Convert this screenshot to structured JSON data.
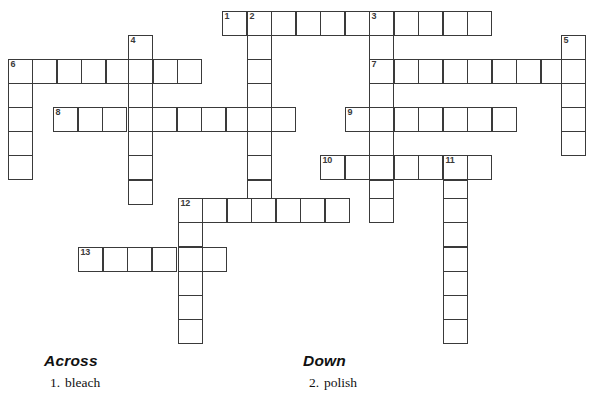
{
  "puzzle": {
    "title": "Crossword Puzzle",
    "cell_size": 24.6,
    "origin_x": 8,
    "origin_y": 10.5,
    "ink_color": "#3a3a3a",
    "cell_fill": "#ffffff",
    "page_background": "#ffffff",
    "entries": [
      {
        "number": "1",
        "direction": "across",
        "col": 0,
        "row": 0,
        "length": 11
      },
      {
        "number": "2",
        "direction": "down",
        "col": 1,
        "row": 0,
        "length": 9
      },
      {
        "number": "3",
        "direction": "down",
        "col": 6,
        "row": 0,
        "length": 7
      },
      {
        "number": "4",
        "direction": "down",
        "col": -11,
        "row": 1,
        "length": 7
      },
      {
        "number": "5",
        "direction": "down",
        "col": 13,
        "row": 1,
        "length": 5
      },
      {
        "number": "6",
        "direction": "across",
        "col": -16,
        "row": 2,
        "length": 8
      },
      {
        "number": "6",
        "direction": "down",
        "col": -16,
        "row": 2,
        "length": 5
      },
      {
        "number": "7",
        "direction": "across",
        "col": 4,
        "row": 2,
        "length": 9
      },
      {
        "number": "8",
        "direction": "across",
        "col": -14,
        "row": 4,
        "length": 10
      },
      {
        "number": "9",
        "direction": "across",
        "col": 2,
        "row": 4,
        "length": 7
      },
      {
        "number": "10",
        "direction": "across",
        "col": 1,
        "row": 6,
        "length": 7
      },
      {
        "number": "11",
        "direction": "down",
        "col": 6,
        "row": 6,
        "length": 8
      },
      {
        "number": "12",
        "direction": "across",
        "col": -8,
        "row": 8,
        "length": 7
      },
      {
        "number": "12",
        "direction": "down",
        "col": -8,
        "row": 8,
        "length": 6
      },
      {
        "number": "13",
        "direction": "across",
        "col": -12,
        "row": 10,
        "length": 6
      }
    ],
    "cells": [
      {
        "x": 222,
        "y": 11,
        "num": "1"
      },
      {
        "x": 247,
        "y": 11,
        "num": "2"
      },
      {
        "x": 271,
        "y": 11,
        "num": ""
      },
      {
        "x": 296,
        "y": 11,
        "num": ""
      },
      {
        "x": 320,
        "y": 11,
        "num": ""
      },
      {
        "x": 345,
        "y": 11,
        "num": ""
      },
      {
        "x": 369,
        "y": 11,
        "num": "3"
      },
      {
        "x": 394,
        "y": 11,
        "num": ""
      },
      {
        "x": 418,
        "y": 11,
        "num": ""
      },
      {
        "x": 443,
        "y": 11,
        "num": ""
      },
      {
        "x": 467,
        "y": 11,
        "num": ""
      },
      {
        "x": 128,
        "y": 35,
        "num": "4"
      },
      {
        "x": 247,
        "y": 35,
        "num": ""
      },
      {
        "x": 369,
        "y": 35,
        "num": ""
      },
      {
        "x": 561,
        "y": 35,
        "num": "5"
      },
      {
        "x": 8,
        "y": 59,
        "num": "6"
      },
      {
        "x": 32,
        "y": 59,
        "num": ""
      },
      {
        "x": 57,
        "y": 59,
        "num": ""
      },
      {
        "x": 81,
        "y": 59,
        "num": ""
      },
      {
        "x": 106,
        "y": 59,
        "num": ""
      },
      {
        "x": 128,
        "y": 59,
        "num": ""
      },
      {
        "x": 153,
        "y": 59,
        "num": ""
      },
      {
        "x": 177,
        "y": 59,
        "num": ""
      },
      {
        "x": 247,
        "y": 59,
        "num": ""
      },
      {
        "x": 369,
        "y": 59,
        "num": "7"
      },
      {
        "x": 394,
        "y": 59,
        "num": ""
      },
      {
        "x": 418,
        "y": 59,
        "num": ""
      },
      {
        "x": 443,
        "y": 59,
        "num": ""
      },
      {
        "x": 467,
        "y": 59,
        "num": ""
      },
      {
        "x": 492,
        "y": 59,
        "num": ""
      },
      {
        "x": 516,
        "y": 59,
        "num": ""
      },
      {
        "x": 541,
        "y": 59,
        "num": ""
      },
      {
        "x": 561,
        "y": 59,
        "num": ""
      },
      {
        "x": 8,
        "y": 83,
        "num": ""
      },
      {
        "x": 128,
        "y": 83,
        "num": ""
      },
      {
        "x": 247,
        "y": 83,
        "num": ""
      },
      {
        "x": 369,
        "y": 83,
        "num": ""
      },
      {
        "x": 561,
        "y": 83,
        "num": ""
      },
      {
        "x": 8,
        "y": 107,
        "num": ""
      },
      {
        "x": 53,
        "y": 107,
        "num": "8"
      },
      {
        "x": 78,
        "y": 107,
        "num": ""
      },
      {
        "x": 102,
        "y": 107,
        "num": ""
      },
      {
        "x": 128,
        "y": 107,
        "num": ""
      },
      {
        "x": 152,
        "y": 107,
        "num": ""
      },
      {
        "x": 177,
        "y": 107,
        "num": ""
      },
      {
        "x": 201,
        "y": 107,
        "num": ""
      },
      {
        "x": 226,
        "y": 107,
        "num": ""
      },
      {
        "x": 247,
        "y": 107,
        "num": ""
      },
      {
        "x": 271,
        "y": 107,
        "num": ""
      },
      {
        "x": 345,
        "y": 107,
        "num": "9"
      },
      {
        "x": 369,
        "y": 107,
        "num": ""
      },
      {
        "x": 394,
        "y": 107,
        "num": ""
      },
      {
        "x": 418,
        "y": 107,
        "num": ""
      },
      {
        "x": 443,
        "y": 107,
        "num": ""
      },
      {
        "x": 467,
        "y": 107,
        "num": ""
      },
      {
        "x": 492,
        "y": 107,
        "num": ""
      },
      {
        "x": 561,
        "y": 107,
        "num": ""
      },
      {
        "x": 8,
        "y": 131,
        "num": ""
      },
      {
        "x": 128,
        "y": 131,
        "num": ""
      },
      {
        "x": 247,
        "y": 131,
        "num": ""
      },
      {
        "x": 369,
        "y": 131,
        "num": ""
      },
      {
        "x": 561,
        "y": 131,
        "num": ""
      },
      {
        "x": 8,
        "y": 155,
        "num": ""
      },
      {
        "x": 128,
        "y": 155,
        "num": ""
      },
      {
        "x": 247,
        "y": 155,
        "num": ""
      },
      {
        "x": 320,
        "y": 155,
        "num": "10"
      },
      {
        "x": 345,
        "y": 155,
        "num": ""
      },
      {
        "x": 369,
        "y": 155,
        "num": ""
      },
      {
        "x": 394,
        "y": 155,
        "num": ""
      },
      {
        "x": 418,
        "y": 155,
        "num": ""
      },
      {
        "x": 443,
        "y": 155,
        "num": "11"
      },
      {
        "x": 467,
        "y": 155,
        "num": ""
      },
      {
        "x": 128,
        "y": 180,
        "num": ""
      },
      {
        "x": 247,
        "y": 180,
        "num": ""
      },
      {
        "x": 369,
        "y": 180,
        "num": ""
      },
      {
        "x": 443,
        "y": 180,
        "num": ""
      },
      {
        "x": 178,
        "y": 198,
        "num": "12"
      },
      {
        "x": 202,
        "y": 198,
        "num": ""
      },
      {
        "x": 227,
        "y": 198,
        "num": ""
      },
      {
        "x": 251,
        "y": 198,
        "num": ""
      },
      {
        "x": 276,
        "y": 198,
        "num": ""
      },
      {
        "x": 300,
        "y": 198,
        "num": ""
      },
      {
        "x": 325,
        "y": 198,
        "num": ""
      },
      {
        "x": 369,
        "y": 198,
        "num": ""
      },
      {
        "x": 443,
        "y": 198,
        "num": ""
      },
      {
        "x": 178,
        "y": 222,
        "num": ""
      },
      {
        "x": 443,
        "y": 222,
        "num": ""
      },
      {
        "x": 78,
        "y": 247,
        "num": "13"
      },
      {
        "x": 103,
        "y": 247,
        "num": ""
      },
      {
        "x": 127,
        "y": 247,
        "num": ""
      },
      {
        "x": 152,
        "y": 247,
        "num": ""
      },
      {
        "x": 178,
        "y": 247,
        "num": ""
      },
      {
        "x": 202,
        "y": 247,
        "num": ""
      },
      {
        "x": 443,
        "y": 247,
        "num": ""
      },
      {
        "x": 178,
        "y": 271,
        "num": ""
      },
      {
        "x": 443,
        "y": 271,
        "num": ""
      },
      {
        "x": 178,
        "y": 295,
        "num": ""
      },
      {
        "x": 443,
        "y": 295,
        "num": ""
      },
      {
        "x": 178,
        "y": 319,
        "num": ""
      },
      {
        "x": 443,
        "y": 319,
        "num": ""
      }
    ]
  },
  "clues": {
    "across": {
      "heading": "Across",
      "items": [
        {
          "number": "1.",
          "text": "bleach"
        }
      ]
    },
    "down": {
      "heading": "Down",
      "items": [
        {
          "number": "2.",
          "text": "polish"
        }
      ]
    }
  }
}
